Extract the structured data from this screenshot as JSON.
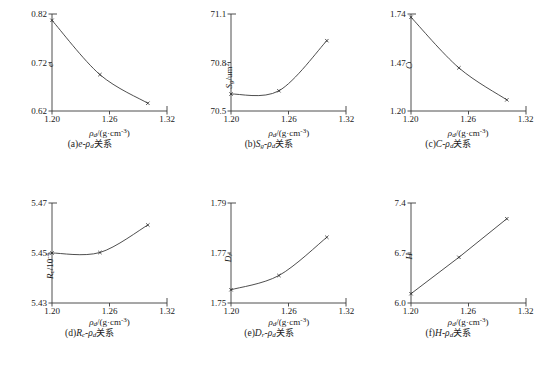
{
  "figure": {
    "xlabel": "ρ",
    "xlabel_sub": "d",
    "xlabel_unit": "/(g·cm",
    "xlabel_exp": "-3",
    "xlabel_close": ")",
    "xticks": [
      "1.20",
      "1.26",
      "1.32"
    ],
    "xlim": [
      1.2,
      1.32
    ],
    "line_color": "#3a3a3a",
    "marker_color": "#2b2b2b"
  },
  "chart_data": [
    {
      "id": "a",
      "type": "line",
      "title": "(a)e-ρd关系",
      "caption_prefix": "(a)",
      "caption_sym": "e",
      "caption_mid": "-ρ",
      "caption_sub": "d",
      "caption_cn": "关系",
      "ylabel_main": "e",
      "ylabel_sub": "",
      "ylabel_unit": "",
      "ylabel_exp": "",
      "xlabel": "ρd/(g·cm-3)",
      "ylim": [
        0.62,
        0.82
      ],
      "yticks": [
        "0.62",
        "0.72",
        "0.82"
      ],
      "ytickvals": [
        0.62,
        0.72,
        0.82
      ],
      "x": [
        1.2,
        1.25,
        1.3
      ],
      "values": [
        0.807,
        0.695,
        0.636
      ]
    },
    {
      "id": "b",
      "type": "line",
      "title": "(b)Sg-ρd关系",
      "caption_prefix": "(b)",
      "caption_sym": "S",
      "caption_sym_sub": "g",
      "caption_mid": "-ρ",
      "caption_sub": "d",
      "caption_cn": "关系",
      "ylabel_main": "S",
      "ylabel_sub": "g",
      "ylabel_unit": "/um",
      "ylabel_exp": "2",
      "xlabel": "ρd/(g·cm-3)",
      "ylim": [
        70.5,
        71.1
      ],
      "yticks": [
        "70.5",
        "70.8",
        "71.1"
      ],
      "ytickvals": [
        70.5,
        70.8,
        71.1
      ],
      "x": [
        1.2,
        1.25,
        1.3
      ],
      "values": [
        70.605,
        70.625,
        70.935
      ]
    },
    {
      "id": "c",
      "type": "line",
      "title": "(c)C-ρd关系",
      "caption_prefix": "(c)",
      "caption_sym": "C",
      "caption_mid": "-ρ",
      "caption_sub": "d",
      "caption_cn": "关系",
      "ylabel_main": "C",
      "ylabel_sub": "",
      "ylabel_unit": "",
      "ylabel_exp": "",
      "xlabel": "ρd/(g·cm-3)",
      "ylim": [
        1.2,
        1.74
      ],
      "yticks": [
        "1.20",
        "1.47",
        "1.74"
      ],
      "ytickvals": [
        1.2,
        1.47,
        1.74
      ],
      "x": [
        1.2,
        1.25,
        1.3
      ],
      "values": [
        1.722,
        1.44,
        1.262
      ]
    },
    {
      "id": "d",
      "type": "line",
      "title": "(d)Rc-ρd关系",
      "caption_prefix": "(d)",
      "caption_sym": "R",
      "caption_sym_sub": "c",
      "caption_mid": "-ρ",
      "caption_sub": "d",
      "caption_cn": "关系",
      "ylabel_main": "R",
      "ylabel_sub": "c",
      "ylabel_unit": "/10",
      "ylabel_exp": "-4",
      "xlabel": "ρd/(g·cm-3)",
      "ylim": [
        5.43,
        5.47
      ],
      "yticks": [
        "5.43",
        "5.45",
        "5.47"
      ],
      "ytickvals": [
        5.43,
        5.45,
        5.47
      ],
      "x": [
        1.2,
        1.25,
        1.3
      ],
      "values": [
        5.45,
        5.4502,
        5.4612
      ]
    },
    {
      "id": "e",
      "type": "line",
      "title": "(e)Dr-ρd关系",
      "caption_prefix": "(e)",
      "caption_sym": "D",
      "caption_sym_sub": "r",
      "caption_mid": "-ρ",
      "caption_sub": "d",
      "caption_cn": "关系",
      "ylabel_main": "D",
      "ylabel_sub": "r",
      "ylabel_unit": "",
      "ylabel_exp": "",
      "xlabel": "ρd/(g·cm-3)",
      "ylim": [
        1.75,
        1.79
      ],
      "yticks": [
        "1.75",
        "1.77",
        "1.79"
      ],
      "ytickvals": [
        1.75,
        1.77,
        1.79
      ],
      "x": [
        1.2,
        1.25,
        1.3
      ],
      "values": [
        1.7553,
        1.761,
        1.7763
      ]
    },
    {
      "id": "f",
      "type": "line",
      "title": "(f)H-ρd关系",
      "caption_prefix": "(f)",
      "caption_sym": "H",
      "caption_mid": "-ρ",
      "caption_sub": "d",
      "caption_cn": "关系",
      "ylabel_main": "H",
      "ylabel_sub": "",
      "ylabel_unit": "",
      "ylabel_exp": "",
      "xlabel": "ρd/(g·cm-3)",
      "ylim": [
        6.0,
        7.4
      ],
      "yticks": [
        "6.0",
        "6.7",
        "7.4"
      ],
      "ytickvals": [
        6.0,
        6.7,
        7.4
      ],
      "x": [
        1.2,
        1.25,
        1.3
      ],
      "values": [
        6.13,
        6.64,
        7.18
      ]
    }
  ]
}
